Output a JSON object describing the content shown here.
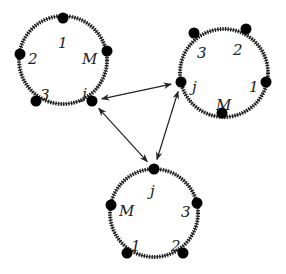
{
  "diagram": {
    "type": "ring-network",
    "rings": [
      {
        "id": "ring-top-left",
        "center": [
          63,
          60
        ],
        "radius": 44,
        "nodes": [
          {
            "label": "1",
            "pos": [
              63,
              18
            ],
            "label_pos": [
              58,
              43
            ]
          },
          {
            "label": "2",
            "pos": [
              20,
              54
            ],
            "label_pos": [
              28,
              59
            ]
          },
          {
            "label": "M",
            "pos": [
              107,
              51
            ],
            "label_pos": [
              82,
              59
            ]
          },
          {
            "label": "3",
            "pos": [
              36,
              101
            ],
            "label_pos": [
              40,
              95
            ]
          },
          {
            "label": "j",
            "pos": [
              92,
              101
            ],
            "label_pos": [
              82,
              94
            ]
          }
        ]
      },
      {
        "id": "ring-top-right",
        "center": [
          224,
          73
        ],
        "radius": 44,
        "nodes": [
          {
            "label": "3",
            "pos": [
              194,
              33
            ],
            "label_pos": [
              197,
              53
            ]
          },
          {
            "label": "2",
            "pos": [
              246,
              29
            ],
            "label_pos": [
              233,
              50
            ]
          },
          {
            "label": "1",
            "pos": [
              266,
              82
            ],
            "label_pos": [
              249,
              87
            ]
          },
          {
            "label": "M",
            "pos": [
              222,
              113
            ],
            "label_pos": [
              216,
              105
            ]
          },
          {
            "label": "j",
            "pos": [
              181,
              82
            ],
            "label_pos": [
              192,
              87
            ]
          }
        ]
      },
      {
        "id": "ring-bottom",
        "center": [
          154,
          213
        ],
        "radius": 44,
        "nodes": [
          {
            "label": "j",
            "pos": [
              154,
              169
            ],
            "label_pos": [
              150,
              191
            ]
          },
          {
            "label": "M",
            "pos": [
              111,
              205
            ],
            "label_pos": [
              119,
              211
            ]
          },
          {
            "label": "3",
            "pos": [
              197,
              203
            ],
            "label_pos": [
              181,
              212
            ]
          },
          {
            "label": "1",
            "pos": [
              127,
              253
            ],
            "label_pos": [
              131,
              246
            ]
          },
          {
            "label": "2",
            "pos": [
              183,
              253
            ],
            "label_pos": [
              171,
              246
            ]
          }
        ]
      }
    ],
    "links": [
      {
        "from": "ring-top-left.j",
        "to": "ring-top-right.j",
        "bidirectional": true
      },
      {
        "from": "ring-top-left.j",
        "to": "ring-bottom.j",
        "bidirectional": true
      },
      {
        "from": "ring-top-right.j",
        "to": "ring-bottom.j",
        "bidirectional": true
      }
    ]
  }
}
